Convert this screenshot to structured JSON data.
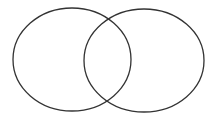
{
  "diagram": {
    "type": "venn",
    "stroke_color": "#333333",
    "background": "#ffffff",
    "sets": [
      {
        "name": "left-set",
        "cx": 72,
        "cy": 59.5,
        "rx": 59,
        "ry": 51.5
      },
      {
        "name": "right-set",
        "cx": 144,
        "cy": 60.5,
        "rx": 60,
        "ry": 51.5
      }
    ]
  }
}
